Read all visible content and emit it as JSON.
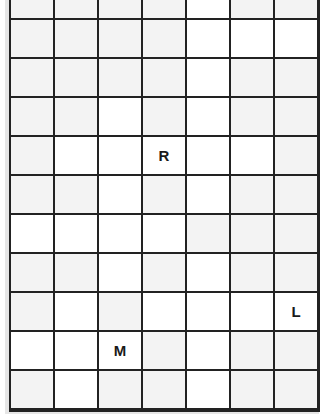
{
  "board": {
    "columns": 7,
    "rows": 11,
    "colors": {
      "gray": "#f3f3f3",
      "white": "#ffffff",
      "line": "#222222"
    },
    "shading": [
      "GGGGWGG",
      "GGGGWWW",
      "GGGGWGG",
      "GGWGWGG",
      "GWWWWWG",
      "GGWGWGG",
      "WWWWGGG",
      "GGWGWGG",
      "GWGWWWW",
      "WWWGWGG",
      "GWGGWGG"
    ],
    "letters": [
      {
        "row": 4,
        "col": 3,
        "letter": "R"
      },
      {
        "row": 8,
        "col": 6,
        "letter": "L"
      },
      {
        "row": 9,
        "col": 2,
        "letter": "M"
      }
    ]
  }
}
